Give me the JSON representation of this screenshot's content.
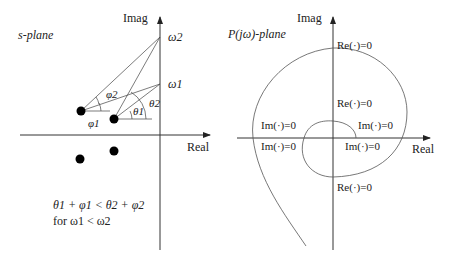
{
  "left_panel": {
    "title": "s-plane",
    "imag_label": "Imag",
    "real_label": "Real",
    "omega1": "ω1",
    "omega2": "ω2",
    "phi1": "φ1",
    "phi2": "φ2",
    "theta1": "θ1",
    "theta2": "θ2",
    "inequality_line1": "θ1 + φ1 < θ2 + φ2",
    "inequality_line2": "for ω1 < ω2",
    "poles": [
      "upper-left pole",
      "upper-right pole",
      "lower-left pole",
      "lower-right pole"
    ]
  },
  "right_panel": {
    "title": "P(jω)-plane",
    "imag_label": "Imag",
    "real_label": "Real",
    "crossings": {
      "outer_top": "Re(·)=0",
      "inner_top": "Re(·)=0",
      "outer_left_above": "Im(·)=0",
      "outer_left_below": "Im(·)=0",
      "inner_right_above": "Im(·)=0",
      "inner_right_below": "Im(·)=0",
      "bottom": "Re(·)=0"
    }
  }
}
